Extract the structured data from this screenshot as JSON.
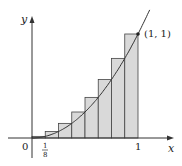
{
  "diagram": {
    "function": "y = x^2",
    "interval": [
      0,
      1
    ],
    "n_rectangles": 8,
    "rule": "right endpoint",
    "rect_heights": [
      0.015625,
      0.0625,
      0.140625,
      0.25,
      0.390625,
      0.5625,
      0.765625,
      1.0
    ],
    "colors": {
      "rect_fill": "#d9d9d9",
      "rect_stroke": "#444444",
      "curve": "#333333",
      "axis": "#333333"
    }
  },
  "labels": {
    "y_axis": "y",
    "x_axis": "x",
    "origin": "0",
    "tick_one": "1",
    "frac_num": "1",
    "frac_den": "8",
    "point": "(1, 1)"
  }
}
